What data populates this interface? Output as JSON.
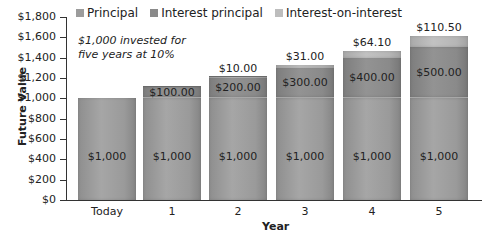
{
  "chart_data": {
    "type": "bar",
    "stacked": true,
    "title": "",
    "annotation": "$1,000 invested for five years at 10%",
    "annotation_lines": [
      "$1,000 invested for",
      "five years at 10%"
    ],
    "xlabel": "Year",
    "ylabel": "Future Value",
    "ylim": [
      0,
      1800
    ],
    "yticks": [
      "$1,800",
      "$1,600",
      "$1,400",
      "$1,200",
      "$1,000",
      "$800",
      "$600",
      "$400",
      "$200",
      "$0"
    ],
    "ytick_values": [
      1800,
      1600,
      1400,
      1200,
      1000,
      800,
      600,
      400,
      200,
      0
    ],
    "categories": [
      "Today",
      "1",
      "2",
      "3",
      "4",
      "5"
    ],
    "legend_position": "top",
    "grid": false,
    "series": [
      {
        "name": "Principal",
        "color": "#9c9c9c",
        "values": [
          1000,
          1000,
          1000,
          1000,
          1000,
          1000
        ],
        "labels": [
          "$1,000",
          "$1,000",
          "$1,000",
          "$1,000",
          "$1,000",
          "$1,000"
        ]
      },
      {
        "name": "Interest principal",
        "color": "#8a8a8a",
        "values": [
          0,
          100,
          200,
          300,
          400,
          500
        ],
        "labels": [
          "",
          "$100.00",
          "$200.00",
          "$300.00",
          "$400.00",
          "$500.00"
        ]
      },
      {
        "name": "Interest-on-interest",
        "color": "#b5b5b5",
        "values": [
          0,
          0,
          10,
          31,
          64.1,
          110.5
        ],
        "labels": [
          "",
          "",
          "$10.00",
          "$31.00",
          "$64.10",
          "$110.50"
        ]
      }
    ]
  },
  "legend": {
    "items": [
      {
        "label": "Principal",
        "color": "#9c9c9c"
      },
      {
        "label": "Interest principal",
        "color": "#8a8a8a"
      },
      {
        "label": "Interest-on-interest",
        "color": "#bdbdbd"
      }
    ]
  },
  "axes": {
    "xlabel": "Year",
    "ylabel": "Future Value"
  },
  "note": {
    "line1": "$1,000 invested for",
    "line2": "five years at 10%"
  }
}
